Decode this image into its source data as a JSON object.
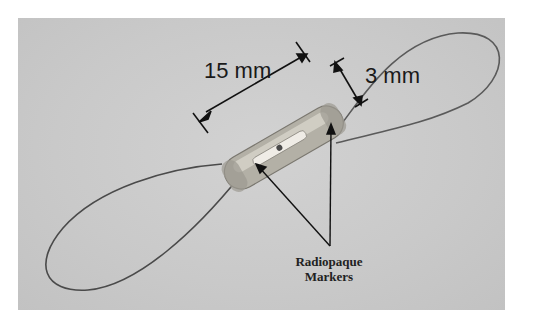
{
  "figure": {
    "background_color": "#c9c9c9",
    "annotations": {
      "length_label": "15 mm",
      "diameter_label": "3 mm",
      "marker_label_line1": "Radiopaque",
      "marker_label_line2": "Markers"
    }
  }
}
